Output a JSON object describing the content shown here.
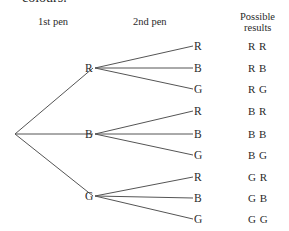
{
  "caption": "colours.",
  "headers": {
    "first": "1st pen",
    "second": "2nd pen",
    "results_line1": "Possible",
    "results_line2": "results"
  },
  "tree": {
    "root": {
      "x": 15,
      "y": 134
    },
    "first_level": [
      {
        "label": "R",
        "x": 100,
        "y": 68
      },
      {
        "label": "B",
        "x": 100,
        "y": 134
      },
      {
        "label": "G",
        "x": 100,
        "y": 196
      }
    ],
    "second_level": [
      {
        "parent": 0,
        "label": "R",
        "result": "R R",
        "y": 46
      },
      {
        "parent": 0,
        "label": "B",
        "result": "R B",
        "y": 68
      },
      {
        "parent": 0,
        "label": "G",
        "result": "R G",
        "y": 89
      },
      {
        "parent": 1,
        "label": "R",
        "result": "B R",
        "y": 111
      },
      {
        "parent": 1,
        "label": "B",
        "result": "B B",
        "y": 134
      },
      {
        "parent": 1,
        "label": "G",
        "result": "B G",
        "y": 155
      },
      {
        "parent": 2,
        "label": "R",
        "result": "G R",
        "y": 177
      },
      {
        "parent": 2,
        "label": "B",
        "result": "G B",
        "y": 198
      },
      {
        "parent": 2,
        "label": "G",
        "result": "G G",
        "y": 219
      }
    ]
  }
}
